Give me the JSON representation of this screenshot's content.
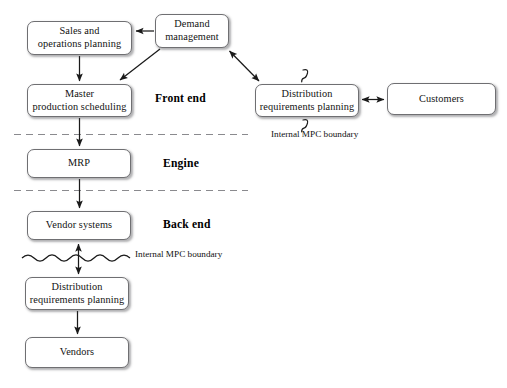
{
  "diagram": {
    "background_color": "#ffffff",
    "box_border_color": "#6f6f72",
    "line_color": "#1a1a1a",
    "dashed_line_color": "#8a8a8e",
    "nodes": [
      {
        "id": "sales_ops",
        "label_lines": [
          "Sales and",
          "operations planning"
        ],
        "x": 27,
        "y": 21,
        "w": 105,
        "h": 34
      },
      {
        "id": "demand_mgmt",
        "label_lines": [
          "Demand",
          "management"
        ],
        "x": 155,
        "y": 14,
        "w": 74,
        "h": 34
      },
      {
        "id": "master_prod",
        "label_lines": [
          "Master",
          "production scheduling"
        ],
        "x": 27,
        "y": 84,
        "w": 105,
        "h": 33
      },
      {
        "id": "drp_front",
        "label_lines": [
          "Distribution",
          "requirements planning"
        ],
        "x": 255,
        "y": 84,
        "w": 104,
        "h": 33
      },
      {
        "id": "customers",
        "label_lines": [
          "Customers"
        ],
        "x": 387,
        "y": 83,
        "w": 109,
        "h": 32
      },
      {
        "id": "mrp",
        "label_lines": [
          "MRP"
        ],
        "x": 27,
        "y": 149,
        "w": 104,
        "h": 29
      },
      {
        "id": "vendor_systems",
        "label_lines": [
          "Vendor systems"
        ],
        "x": 27,
        "y": 211,
        "w": 104,
        "h": 29
      },
      {
        "id": "drp_back",
        "label_lines": [
          "Distribution",
          "requirements planning"
        ],
        "x": 25,
        "y": 277,
        "w": 104,
        "h": 33
      },
      {
        "id": "vendors",
        "label_lines": [
          "Vendors"
        ],
        "x": 25,
        "y": 337,
        "w": 104,
        "h": 31
      }
    ],
    "zone_labels": [
      {
        "id": "front_end",
        "text": "Front end",
        "x": 155,
        "y": 92
      },
      {
        "id": "engine",
        "text": "Engine",
        "x": 163,
        "y": 157
      },
      {
        "id": "back_end",
        "text": "Back end",
        "x": 163,
        "y": 218
      }
    ],
    "notes": [
      {
        "id": "internal_mpc_boundary_right",
        "lines": [
          "Internal MPC",
          "boundary"
        ],
        "x": 271,
        "y": 129
      },
      {
        "id": "internal_mpc_boundary_left",
        "lines": [
          "Internal MPC",
          "boundary"
        ],
        "x": 135,
        "y": 249
      }
    ],
    "dividers": [
      {
        "id": "front-engine-divider",
        "y": 134,
        "x1": 14,
        "x2": 248,
        "style": "dashed"
      },
      {
        "id": "engine-back-divider",
        "y": 190,
        "x1": 14,
        "x2": 248,
        "style": "dashed"
      }
    ],
    "squiggles": [
      {
        "id": "squiggle-above-drp-front",
        "x": 305,
        "y": 71
      },
      {
        "id": "squiggle-below-drp-front",
        "x": 305,
        "y": 120
      }
    ],
    "wavy_boundary": {
      "id": "wavy-mpc-boundary",
      "x1": 22,
      "x2": 131,
      "y": 258,
      "periods": 9
    },
    "connectors": [
      {
        "id": "demand-to-sales",
        "from": "demand_mgmt",
        "to": "sales_ops",
        "heads": "single"
      },
      {
        "id": "demand-to-master",
        "from": "demand_mgmt",
        "to": "master_prod",
        "heads": "single"
      },
      {
        "id": "demand-to-drp-front",
        "from": "demand_mgmt",
        "to": "drp_front",
        "heads": "double"
      },
      {
        "id": "sales-to-master",
        "from": "sales_ops",
        "to": "master_prod",
        "heads": "single"
      },
      {
        "id": "drp-front-to-customers",
        "from": "drp_front",
        "to": "customers",
        "heads": "double"
      },
      {
        "id": "master-to-mrp",
        "from": "master_prod",
        "to": "mrp",
        "heads": "single"
      },
      {
        "id": "mrp-to-vendor-systems",
        "from": "mrp",
        "to": "vendor_systems",
        "heads": "single"
      },
      {
        "id": "vendor-systems-to-drp-back",
        "from": "vendor_systems",
        "to": "drp_back",
        "heads": "double"
      },
      {
        "id": "drp-back-to-vendors",
        "from": "drp_back",
        "to": "vendors",
        "heads": "single"
      }
    ]
  }
}
